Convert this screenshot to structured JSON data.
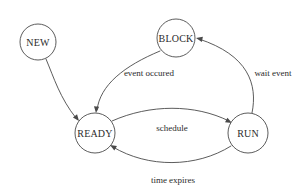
{
  "diagram": {
    "type": "state-transition-diagram",
    "background_color": "#ffffff",
    "line_color": "#4a4a4a",
    "text_color": "#2b2b2b",
    "states": [
      {
        "id": "new",
        "label": "NEW",
        "cx": 38,
        "cy": 42,
        "r": 18
      },
      {
        "id": "block",
        "label": "BLOCK",
        "cx": 176,
        "cy": 38,
        "r": 19
      },
      {
        "id": "ready",
        "label": "READY",
        "cx": 95,
        "cy": 133,
        "r": 20
      },
      {
        "id": "run",
        "label": "RUN",
        "cx": 248,
        "cy": 133,
        "r": 20
      }
    ],
    "transitions": [
      {
        "id": "new-to-ready",
        "from": "new",
        "to": "ready",
        "label": "",
        "path": "M 46,59 C 54,78 60,98 76,118",
        "arrow": {
          "x": 79,
          "y": 121,
          "angle": 52
        }
      },
      {
        "id": "block-to-ready",
        "from": "block",
        "to": "ready",
        "label": "event occured",
        "label_x": 149,
        "label_y": 73,
        "path": "M 160,51 C 124,66 100,85 97,110",
        "arrow": {
          "x": 96,
          "y": 113,
          "angle": 95
        }
      },
      {
        "id": "run-to-block",
        "from": "run",
        "to": "block",
        "label": "wait event",
        "label_x": 273,
        "label_y": 73,
        "path": "M 252,113 C 258,84 248,55 199,39",
        "arrow": {
          "x": 196,
          "y": 38,
          "angle": 192
        }
      },
      {
        "id": "ready-to-run",
        "from": "ready",
        "to": "run",
        "label": "schedule",
        "label_x": 172,
        "label_y": 128,
        "path": "M 112,121 C 150,104 195,104 229,121",
        "arrow": {
          "x": 232,
          "y": 123,
          "angle": 27
        }
      },
      {
        "id": "run-to-ready",
        "from": "run",
        "to": "ready",
        "label": "time expires",
        "label_x": 173,
        "label_y": 180,
        "path": "M 231,146 C 196,168 148,168 113,147",
        "arrow": {
          "x": 110,
          "y": 145,
          "angle": 210
        }
      }
    ]
  }
}
